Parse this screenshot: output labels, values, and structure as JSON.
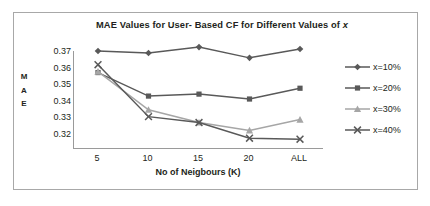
{
  "figure": {
    "border_color": "#a8a8a8"
  },
  "chart_data": {
    "type": "line",
    "title": "MAE Values for User- Based CF for Different  Values of ",
    "title_italic_suffix": "x",
    "xlabel": "No of Neigbours (K)",
    "ylabel": "MAE",
    "ylabel_stacked": [
      "M",
      "A",
      "E"
    ],
    "categories": [
      "5",
      "10",
      "15",
      "20",
      "ALL"
    ],
    "yticks": [
      "0.37",
      "0.36",
      "0.35",
      "0.34",
      "0.33",
      "0.32"
    ],
    "ylim": [
      0.32,
      0.37
    ],
    "grid": false,
    "legend_position": "right",
    "series": [
      {
        "name": "x=10%",
        "marker": "diamond",
        "color": "#595959",
        "values": [
          0.37,
          0.369,
          0.372,
          0.3665,
          0.371
        ]
      },
      {
        "name": "x=20%",
        "marker": "square",
        "color": "#595959",
        "values": [
          0.359,
          0.347,
          0.348,
          0.3455,
          0.351
        ]
      },
      {
        "name": "x=30%",
        "marker": "triangle",
        "color": "#a6a6a6",
        "values": [
          0.3595,
          0.34,
          0.3335,
          0.3295,
          0.335
        ]
      },
      {
        "name": "x=40%",
        "marker": "x",
        "color": "#595959",
        "values": [
          0.363,
          0.3365,
          0.3335,
          0.3255,
          0.325
        ]
      }
    ]
  }
}
